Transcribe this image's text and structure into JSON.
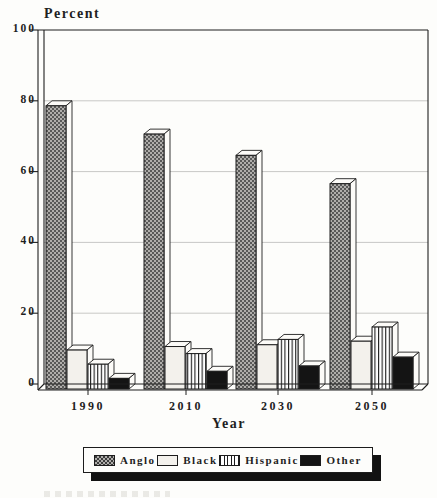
{
  "page": {
    "background": "#fdfdfb"
  },
  "chart_data": {
    "type": "bar",
    "style": "3d-grouped-bars-scanned-print",
    "title": "Percent",
    "ylabel": "Percent",
    "xlabel": "Year",
    "categories": [
      "1990",
      "2010",
      "2030",
      "2050"
    ],
    "series": [
      {
        "name": "Anglo",
        "pattern": "halftone-dots",
        "values": [
          80,
          72,
          66,
          58
        ]
      },
      {
        "name": "Black",
        "pattern": "plain-light",
        "values": [
          11,
          12,
          12.5,
          13.5
        ]
      },
      {
        "name": "Hispanic",
        "pattern": "vertical-stripes",
        "values": [
          7,
          10,
          14,
          17.5
        ]
      },
      {
        "name": "Other",
        "pattern": "solid-black",
        "values": [
          3,
          5,
          6.5,
          9
        ]
      }
    ],
    "ylim": [
      0,
      100
    ],
    "yticks": [
      0,
      20,
      40,
      60,
      80,
      100
    ],
    "grid": true,
    "legend_position": "bottom"
  },
  "legend": {
    "items": [
      {
        "label": "Anglo"
      },
      {
        "label": "Black"
      },
      {
        "label": "Hispanic"
      },
      {
        "label": "Other"
      }
    ]
  },
  "colors": {
    "ink": "#1f1f1f",
    "paper": "#fdfdfb",
    "grid": "#c8c8c6",
    "halftone_base": "#b0aeab",
    "halftone_dot": "#3c3c3c",
    "light_face": "#f3f1ec",
    "stripe_ink": "#1c1c1c",
    "solid_black": "#141414",
    "face_white": "#fcfbf8"
  }
}
